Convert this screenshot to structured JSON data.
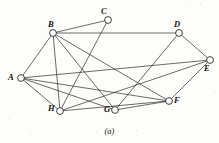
{
  "figure": {
    "caption": "(a)",
    "caption_x": 0,
    "caption_y": 126,
    "width": 219,
    "height": 143,
    "background_color": "#fdfdfb",
    "line_color": "#2b2b2b",
    "node_fill_color": "#ffffff",
    "node_stroke_color": "#1d1d1d"
  },
  "graph": {
    "type": "undirected-graph",
    "vertex_count": 8,
    "edge_count": 16,
    "vertices": [
      {
        "id": "A",
        "label": "A",
        "cx": 21,
        "cy": 78,
        "r": 3.4,
        "label_x": 8,
        "label_y": 73
      },
      {
        "id": "B",
        "label": "B",
        "cx": 53,
        "cy": 33,
        "r": 3.4,
        "label_x": 48,
        "label_y": 20
      },
      {
        "id": "C",
        "label": "C",
        "cx": 108,
        "cy": 20,
        "r": 3.4,
        "label_x": 101,
        "label_y": 7
      },
      {
        "id": "D",
        "label": "D",
        "cx": 179,
        "cy": 33,
        "r": 3.4,
        "label_x": 174,
        "label_y": 20
      },
      {
        "id": "E",
        "label": "E",
        "cx": 210,
        "cy": 60,
        "r": 3.4,
        "label_x": 204,
        "label_y": 64
      },
      {
        "id": "F",
        "label": "F",
        "cx": 169,
        "cy": 101,
        "r": 3.4,
        "label_x": 174,
        "label_y": 96
      },
      {
        "id": "G",
        "label": "G",
        "cx": 115,
        "cy": 110,
        "r": 3.4,
        "label_x": 104,
        "label_y": 105
      },
      {
        "id": "H",
        "label": "H",
        "cx": 60,
        "cy": 111,
        "r": 3.4,
        "label_x": 48,
        "label_y": 104
      }
    ],
    "edges": [
      {
        "from": "A",
        "to": "B"
      },
      {
        "from": "A",
        "to": "H"
      },
      {
        "from": "A",
        "to": "E"
      },
      {
        "from": "A",
        "to": "F"
      },
      {
        "from": "A",
        "to": "G"
      },
      {
        "from": "B",
        "to": "C"
      },
      {
        "from": "B",
        "to": "D"
      },
      {
        "from": "B",
        "to": "H"
      },
      {
        "from": "B",
        "to": "F"
      },
      {
        "from": "B",
        "to": "G"
      },
      {
        "from": "C",
        "to": "H"
      },
      {
        "from": "D",
        "to": "E"
      },
      {
        "from": "D",
        "to": "G"
      },
      {
        "from": "E",
        "to": "F"
      },
      {
        "from": "E",
        "to": "H"
      },
      {
        "from": "F",
        "to": "G"
      },
      {
        "from": "F",
        "to": "H"
      }
    ],
    "specks": [
      {
        "x": 186,
        "y": 6,
        "size": 1.4
      },
      {
        "x": 200,
        "y": 4,
        "size": 1.1
      },
      {
        "x": 9,
        "y": 118,
        "size": 1.2
      },
      {
        "x": 30,
        "y": 134,
        "size": 1.0
      },
      {
        "x": 136,
        "y": 130,
        "size": 1.1
      },
      {
        "x": 96,
        "y": 131,
        "size": 1.0
      },
      {
        "x": 214,
        "y": 92,
        "size": 1.2
      }
    ]
  }
}
